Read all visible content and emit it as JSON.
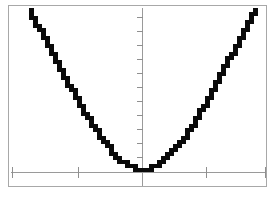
{
  "screen": {
    "type": "graphing-calculator-plot",
    "width": 274,
    "height": 208,
    "background_color": "#ffffff",
    "frame_color": "#a8a8a8",
    "axis_color": "#9a9a9a",
    "curve_color": "#0a0a0a",
    "title": "",
    "labels_visible": false
  },
  "chart_data": {
    "type": "line",
    "title": "",
    "subtitle": "",
    "xlabel": "",
    "ylabel": "",
    "grid": false,
    "legend": [],
    "legend_position": "none",
    "axis_style": "centered-cross",
    "xlim": [
      -10,
      10
    ],
    "ylim": [
      -1,
      10
    ],
    "x_ticks": [
      -10,
      -5,
      5,
      10
    ],
    "y_ticks": [
      1,
      2,
      3,
      4,
      5,
      6,
      7,
      8,
      9,
      10,
      11
    ],
    "x_tick_labels": [],
    "y_tick_labels": [],
    "series": [
      {
        "name": "y = x^6",
        "color": "#0a0a0a",
        "line_width": 3,
        "rendering": "pixelated-staircase",
        "x": [
          -10.0,
          -9.5,
          -9.0,
          -8.5,
          -8.0,
          -7.5,
          -7.0,
          -6.5,
          -6.0,
          -5.5,
          -5.0,
          -4.5,
          -4.0,
          -3.5,
          -3.0,
          -2.5,
          -2.0,
          -1.5,
          -1.0,
          -0.5,
          0.0,
          0.5,
          1.0,
          1.5,
          2.0,
          2.5,
          3.0,
          3.5,
          4.0,
          4.5,
          5.0,
          5.5,
          6.0,
          6.5,
          7.0,
          7.5,
          8.0,
          8.5,
          9.0,
          9.5,
          10.0
        ],
        "y": [
          11.0,
          10.3,
          9.6,
          8.9,
          8.2,
          7.5,
          6.8,
          6.1,
          5.4,
          4.7,
          4.0,
          3.4,
          2.8,
          2.25,
          1.75,
          1.3,
          0.92,
          0.6,
          0.36,
          0.18,
          0.08,
          0.18,
          0.36,
          0.6,
          0.92,
          1.3,
          1.75,
          2.25,
          2.8,
          3.4,
          4.0,
          4.7,
          5.4,
          6.1,
          6.8,
          7.5,
          8.2,
          8.9,
          9.6,
          10.3,
          11.0
        ]
      }
    ]
  }
}
